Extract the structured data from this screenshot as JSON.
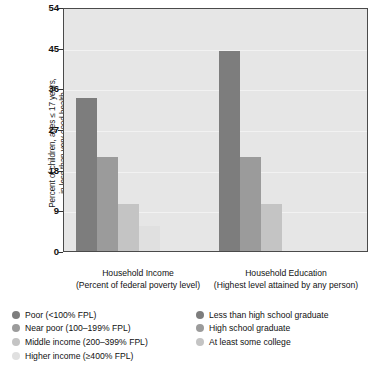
{
  "chart_data": {
    "type": "bar",
    "title": "",
    "xlabel": "",
    "ylabel": "Percent of children, ages ≤ 17 years,\nin less than very good health",
    "ylim": [
      0,
      54
    ],
    "yticks": [
      0,
      9,
      18,
      27,
      36,
      45,
      54
    ],
    "grid": true,
    "legend_position": "below",
    "groups": [
      {
        "name": "Household Income",
        "sublabel": "(Percent of federal poverty level)",
        "categories": [
          "Poor (<100% FPL)",
          "Near poor (100–199% FPL)",
          "Middle income (200–399% FPL)",
          "Higher income (≥400% FPL)"
        ],
        "values": [
          33.9,
          20.8,
          10.4,
          5.6
        ],
        "colors": [
          "#7d7d7d",
          "#9b9b9b",
          "#c4c4c4",
          "#e0e0e0"
        ]
      },
      {
        "name": "Household Education",
        "sublabel": "(Highest level attained by any person)",
        "categories": [
          "Less than high school graduate",
          "High school graduate",
          "At least some college"
        ],
        "values": [
          44.3,
          20.8,
          10.4
        ],
        "colors": [
          "#7d7d7d",
          "#9b9b9b",
          "#c4c4c4"
        ]
      }
    ]
  },
  "axis": {
    "y_title": "Percent of children, ages ≤ 17 years,\nin less than very good health",
    "tick_54": "54",
    "tick_45": "45",
    "tick_36": "36",
    "tick_27": "27",
    "tick_18": "18",
    "tick_9": "9",
    "tick_0": "0"
  },
  "groups": {
    "income": {
      "title": "Household Income",
      "subtitle": "(Percent of federal poverty level)"
    },
    "education": {
      "title": "Household Education",
      "subtitle": "(Highest level attained by any person)"
    }
  },
  "legend_income": [
    {
      "label": "Poor (<100% FPL)",
      "color": "#7d7d7d"
    },
    {
      "label": "Near poor (100–199% FPL)",
      "color": "#9b9b9b"
    },
    {
      "label": "Middle income (200–399% FPL)",
      "color": "#c4c4c4"
    },
    {
      "label": "Higher income (≥400% FPL)",
      "color": "#e0e0e0"
    }
  ],
  "legend_education": [
    {
      "label": "Less than high school graduate",
      "color": "#7d7d7d"
    },
    {
      "label": "High school graduate",
      "color": "#9b9b9b"
    },
    {
      "label": "At least some college",
      "color": "#c4c4c4"
    }
  ],
  "page_bleed": "of socioeconomic status, and\nfor children in poor and near poor\nhouseholds, health status is lower\nthan for children in higher income"
}
